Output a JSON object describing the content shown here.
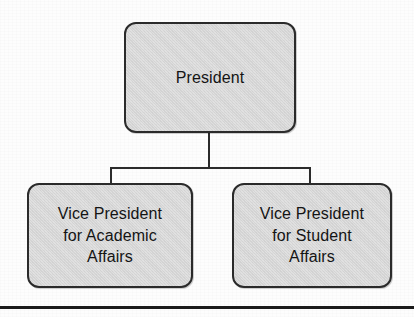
{
  "diagram": {
    "type": "organizational-chart",
    "colors": {
      "node_fill": "#d9d9d9",
      "node_border": "#2b2b2b",
      "connector": "#2b2b2b",
      "text": "#141414",
      "page_background": "#fdfdfd",
      "page_rule": "#1a1a1a"
    },
    "nodes": [
      {
        "id": "president",
        "label": "President",
        "level": 0
      },
      {
        "id": "vp-academic",
        "label": "Vice President\nfor Academic\nAffairs",
        "level": 1
      },
      {
        "id": "vp-student",
        "label": "Vice President\nfor Student\nAffairs",
        "level": 1
      }
    ],
    "edges": [
      {
        "from": "president",
        "to": "vp-academic"
      },
      {
        "from": "president",
        "to": "vp-student"
      }
    ]
  }
}
